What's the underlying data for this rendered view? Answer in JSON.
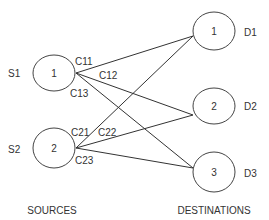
{
  "diagram": {
    "type": "bipartite-transportation-network",
    "colors": {
      "stroke": "#444444",
      "text": "#333333",
      "background": "#ffffff"
    },
    "sources": {
      "caption": "SOURCES",
      "nodes": [
        {
          "id": "S1",
          "label": "S1",
          "number": "1"
        },
        {
          "id": "S2",
          "label": "S2",
          "number": "2"
        }
      ]
    },
    "destinations": {
      "caption": "DESTINATIONS",
      "nodes": [
        {
          "id": "D1",
          "label": "D1",
          "number": "1"
        },
        {
          "id": "D2",
          "label": "D2",
          "number": "2"
        },
        {
          "id": "D3",
          "label": "D3",
          "number": "3"
        }
      ]
    },
    "edges": [
      {
        "from": "S1",
        "to": "D1",
        "label": "C11"
      },
      {
        "from": "S1",
        "to": "D2",
        "label": "C12"
      },
      {
        "from": "S1",
        "to": "D3",
        "label": "C13"
      },
      {
        "from": "S2",
        "to": "D1",
        "label": "C21"
      },
      {
        "from": "S2",
        "to": "D2",
        "label": "C22"
      },
      {
        "from": "S2",
        "to": "D3",
        "label": "C23"
      }
    ]
  }
}
